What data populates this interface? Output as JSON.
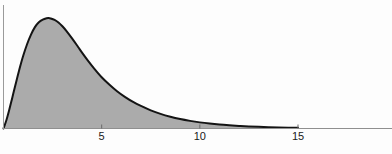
{
  "figure": {
    "background_color": "#fdfdfd",
    "width": 392,
    "height": 154
  },
  "style": {
    "fill_color": "#ababab",
    "curve_color": "#141414",
    "axis_color": "#8f8f8f",
    "yaxis_color": "#9a9a9a",
    "tick_color": "#6a6a6a",
    "label_color": "#1a1a1a",
    "curve_width": 2.0,
    "axis_width": 1.0
  },
  "chart_data": {
    "type": "area",
    "title": "",
    "subtitle": "",
    "xlabel": "",
    "ylabel": "",
    "xlim": [
      0,
      19.6
    ],
    "ylim": [
      0,
      0.2265
    ],
    "grid": false,
    "legend": null,
    "annotations": [],
    "xticks": [
      5,
      10,
      15
    ],
    "xtick_labels": [
      "5",
      "10",
      "15"
    ],
    "yticks": [],
    "ytick_labels": [],
    "series": [
      {
        "name": "density",
        "fill": true,
        "x": [
          0.0,
          0.15,
          0.3,
          0.45,
          0.6,
          0.8,
          1.0,
          1.2,
          1.4,
          1.6,
          1.8,
          2.0,
          2.2,
          2.3,
          2.4,
          2.6,
          2.8,
          3.0,
          3.2,
          3.5,
          3.8,
          4.0,
          4.3,
          4.6,
          5.0,
          5.4,
          5.8,
          6.2,
          6.6,
          7.0,
          7.5,
          8.0,
          8.5,
          9.0,
          9.5,
          10.0,
          10.5,
          11.0,
          11.5,
          12.0,
          12.5,
          13.0,
          13.5,
          14.0,
          14.5,
          15.0
        ],
        "y": [
          0.0,
          0.016,
          0.036,
          0.058,
          0.08,
          0.109,
          0.135,
          0.157,
          0.175,
          0.189,
          0.198,
          0.203,
          0.2055,
          0.2058,
          0.2052,
          0.2025,
          0.1975,
          0.1905,
          0.182,
          0.1675,
          0.152,
          0.1415,
          0.1265,
          0.1125,
          0.0955,
          0.0815,
          0.069,
          0.0585,
          0.0495,
          0.042,
          0.0338,
          0.0272,
          0.0219,
          0.0176,
          0.0142,
          0.0114,
          0.0092,
          0.0074,
          0.006,
          0.0048,
          0.0039,
          0.0031,
          0.0025,
          0.002,
          0.0016,
          0.0013
        ]
      }
    ]
  },
  "axes": {
    "x_axis_name": "x-axis-line",
    "y_axis_name": "y-axis-line"
  }
}
